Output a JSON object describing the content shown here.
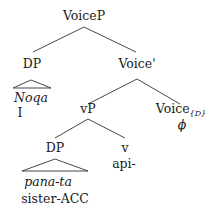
{
  "tree": {
    "root": "VoiceP",
    "dp1": {
      "label": "DP",
      "word": "Noqa",
      "gloss": "I"
    },
    "voice_bar": "Voice'",
    "vp": "vP",
    "dp2": {
      "label": "DP",
      "word": "pana-ta",
      "gloss": "sister-ACC"
    },
    "v": {
      "label": "v",
      "word": "api-"
    },
    "voice_head": {
      "label": "Voice",
      "subscript": "{D}",
      "word": "ϕ"
    }
  }
}
